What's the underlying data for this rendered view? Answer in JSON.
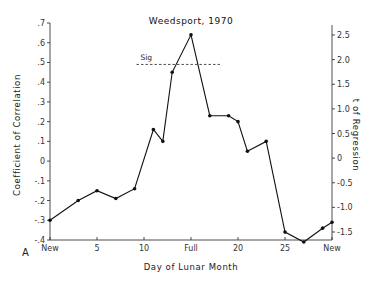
{
  "panel_label": "A",
  "chart_data": {
    "type": "line",
    "title": "Weedsport, 1970",
    "xlabel": "Day of Lunar Month",
    "ylabel": "Coefficient of Correlation",
    "y2label": "t of Regression",
    "xlim": [
      0,
      30
    ],
    "ylim": [
      -0.4,
      0.7
    ],
    "y2lim": [
      -1.5,
      2.5
    ],
    "x_ticks": [
      {
        "value": 0,
        "label": "New"
      },
      {
        "value": 5,
        "label": "5"
      },
      {
        "value": 10,
        "label": "10"
      },
      {
        "value": 15,
        "label": "Full"
      },
      {
        "value": 20,
        "label": "20"
      },
      {
        "value": 25,
        "label": "25"
      },
      {
        "value": 30,
        "label": "New"
      }
    ],
    "y_ticks": [
      {
        "value": 0.7,
        "label": ".7"
      },
      {
        "value": 0.6,
        "label": ".6"
      },
      {
        "value": 0.5,
        "label": ".5"
      },
      {
        "value": 0.4,
        "label": ".4"
      },
      {
        "value": 0.3,
        "label": ".3"
      },
      {
        "value": 0.2,
        "label": ".2"
      },
      {
        "value": 0.1,
        "label": ".1"
      },
      {
        "value": 0.0,
        "label": "0"
      },
      {
        "value": -0.1,
        "label": "-.1"
      },
      {
        "value": -0.2,
        "label": "-.2"
      },
      {
        "value": -0.3,
        "label": "-.3"
      },
      {
        "value": -0.4,
        "label": "-.4"
      }
    ],
    "y2_ticks": [
      {
        "value": 2.5,
        "label": "2.5"
      },
      {
        "value": 2.0,
        "label": "2.0"
      },
      {
        "value": 1.5,
        "label": "1.5"
      },
      {
        "value": 1.0,
        "label": "1.0"
      },
      {
        "value": 0.5,
        "label": "0.5"
      },
      {
        "value": 0.0,
        "label": "0"
      },
      {
        "value": -0.5,
        "label": "-0.5"
      },
      {
        "value": -1.0,
        "label": "-1.0"
      },
      {
        "value": -1.5,
        "label": "-1.5"
      }
    ],
    "series": [
      {
        "name": "Coefficient of Correlation",
        "x": [
          0,
          3,
          5,
          7,
          9,
          11,
          12,
          13,
          15,
          17,
          19,
          20,
          21,
          23,
          25,
          27,
          29,
          30
        ],
        "values": [
          -0.3,
          -0.2,
          -0.15,
          -0.19,
          -0.14,
          0.16,
          0.1,
          0.45,
          0.64,
          0.23,
          0.23,
          0.2,
          0.05,
          0.1,
          -0.36,
          -0.41,
          -0.34,
          -0.31
        ]
      }
    ],
    "annotations": [
      {
        "type": "hline",
        "label": "Sig",
        "y": 0.49,
        "x_start": 9.2,
        "x_end": 18.1,
        "style": "dashed"
      }
    ],
    "grid": false,
    "legend": null
  }
}
